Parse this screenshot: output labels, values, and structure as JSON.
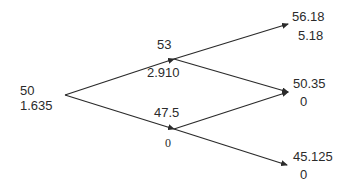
{
  "diagram": {
    "type": "binomial-tree",
    "line_color": "#2b2b2b",
    "nodes": {
      "root": {
        "price": "50",
        "value": "1.635"
      },
      "up": {
        "price": "53",
        "value": "2.910"
      },
      "down": {
        "price": "47.5",
        "value": "0"
      },
      "up_up": {
        "price": "56.18",
        "value": "5.18"
      },
      "up_down": {
        "price": "50.35",
        "value": "0"
      },
      "down_down": {
        "price": "45.125",
        "value": "0"
      }
    },
    "edges": [
      {
        "from": "root",
        "to": "up"
      },
      {
        "from": "root",
        "to": "down"
      },
      {
        "from": "up",
        "to": "up_up"
      },
      {
        "from": "up",
        "to": "up_down"
      },
      {
        "from": "down",
        "to": "up_down"
      },
      {
        "from": "down",
        "to": "down_down"
      }
    ]
  }
}
